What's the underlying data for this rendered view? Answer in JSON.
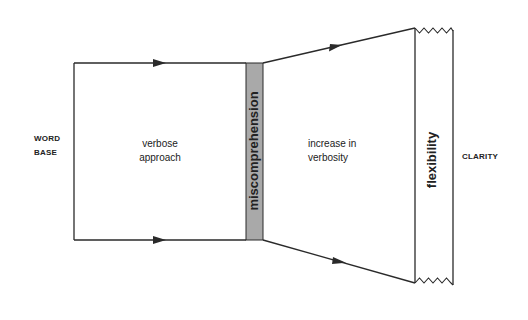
{
  "diagram": {
    "labels": {
      "source": [
        "WORD",
        "BASE"
      ],
      "left_region": [
        "verbose",
        "approach"
      ],
      "barrier": "miscomprehension",
      "right_region": [
        "increase in",
        "verbosity"
      ],
      "band": "flexibility",
      "target": "CLARITY"
    },
    "colors": {
      "line": "#2a2a2a",
      "barrier_fill": "#a9a9a9",
      "background": "#ffffff"
    }
  }
}
